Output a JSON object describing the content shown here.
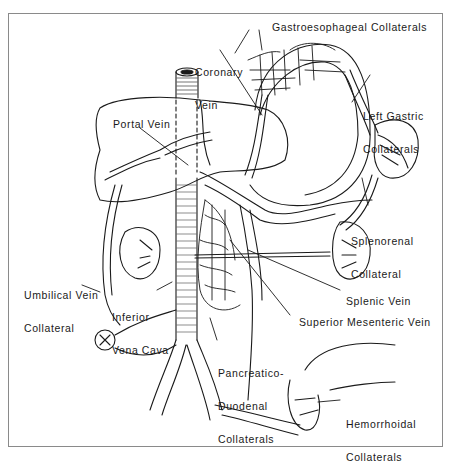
{
  "figure": {
    "colors": {
      "line": "#1a1a1a",
      "background": "#ffffff",
      "frame": "#8a8a8a"
    }
  },
  "labels": {
    "gastroesophageal": "Gastroesophageal Collaterals",
    "coronary_line1": "Coronary",
    "coronary_line2": "Vein",
    "left_gastric_line1": "Left Gastric",
    "left_gastric_line2": "Collaterals",
    "portal_vein": "Portal Vein",
    "splenorenal_line1": "Splenorenal",
    "splenorenal_line2": "Collateral",
    "umbilical_line1": "Umbilical Vein",
    "umbilical_line2": "Collateral",
    "ivc_line1": "Inferior",
    "ivc_line2": "Vena Cava",
    "splenic_vein": "Splenic Vein",
    "smv": "Superior Mesenteric Vein",
    "pancreatico_line1": "Pancreatico-",
    "pancreatico_line2": "Duodenal",
    "pancreatico_line3": "Collaterals",
    "hemorrhoidal_line1": "Hemorrhoidal",
    "hemorrhoidal_line2": "Collaterals"
  }
}
